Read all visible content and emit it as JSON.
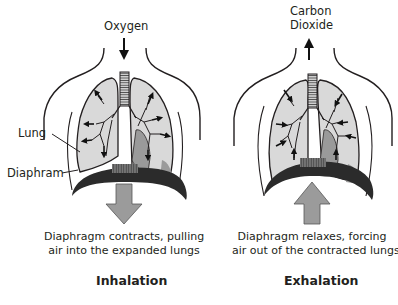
{
  "diagram": {
    "panels": [
      {
        "id": "inhalation",
        "gas_label": [
          "Oxygen"
        ],
        "gas_direction": "down",
        "caption": [
          "Diaphragm contracts, pulling",
          "air into the expanded lungs"
        ],
        "title": "Inhalation",
        "diaphragm_arrow": "down"
      },
      {
        "id": "exhalation",
        "gas_label": [
          "Carbon",
          "Dioxide"
        ],
        "gas_direction": "up",
        "caption": [
          "Diaphragm relaxes, forcing",
          "air out of the contracted lungs"
        ],
        "title": "Exhalation",
        "diaphragm_arrow": "up"
      }
    ],
    "callouts": {
      "lung": "Lung",
      "diaphragm": "Diaphram"
    },
    "colors": {
      "outline": "#231f20",
      "lung_fill": "#d9d9d9",
      "heart_fill": "#9a9a9a",
      "diaphragm_fill": "#2b2b2b",
      "arrow_fill": "#9b9b9b"
    }
  }
}
